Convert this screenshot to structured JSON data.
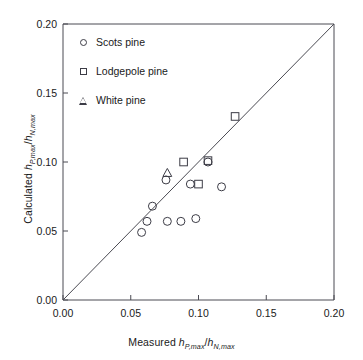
{
  "chart_data": {
    "type": "scatter",
    "title": "",
    "xlabel": "Measured h_{P,max}/h_{N,max}",
    "ylabel": "Calculated h_{P,max}/h_{N,max}",
    "xlim": [
      0.0,
      0.2
    ],
    "ylim": [
      0.0,
      0.2
    ],
    "xticks": [
      "0.00",
      "0.05",
      "0.10",
      "0.15",
      "0.20"
    ],
    "yticks": [
      "0.00",
      "0.05",
      "0.10",
      "0.15",
      "0.20"
    ],
    "xtick_values": [
      0.0,
      0.05,
      0.1,
      0.15,
      0.2
    ],
    "ytick_values": [
      0.0,
      0.05,
      0.1,
      0.15,
      0.2
    ],
    "grid": false,
    "legend_position": "upper-left",
    "reference_line": {
      "type": "identity",
      "from": [
        0.0,
        0.0
      ],
      "to": [
        0.2,
        0.2
      ],
      "label": "1:1 line"
    },
    "series": [
      {
        "name": "Scots pine",
        "marker": "circle",
        "color": "#3c3c46",
        "points": [
          [
            0.058,
            0.049
          ],
          [
            0.062,
            0.057
          ],
          [
            0.066,
            0.068
          ],
          [
            0.076,
            0.087
          ],
          [
            0.077,
            0.057
          ],
          [
            0.087,
            0.057
          ],
          [
            0.098,
            0.059
          ],
          [
            0.094,
            0.084
          ],
          [
            0.107,
            0.1
          ],
          [
            0.117,
            0.082
          ]
        ]
      },
      {
        "name": "Lodgepole pine",
        "marker": "square",
        "color": "#3c3c46",
        "points": [
          [
            0.089,
            0.1
          ],
          [
            0.1,
            0.084
          ],
          [
            0.107,
            0.101
          ],
          [
            0.127,
            0.133
          ]
        ]
      },
      {
        "name": "White pine",
        "marker": "triangle",
        "color": "#3c3c46",
        "points": [
          [
            0.077,
            0.092
          ]
        ]
      }
    ]
  },
  "axis": {
    "x_label_parts": {
      "prefix": "Measured ",
      "h1": "h",
      "sub1": "P,max",
      "slash": "/",
      "h2": "h",
      "sub2": "N,max"
    },
    "y_label_parts": {
      "prefix": "Calculated ",
      "h1": "h",
      "sub1": "P,max",
      "slash": "/",
      "h2": "h",
      "sub2": "N,max"
    }
  },
  "legend": {
    "items": [
      {
        "label": "Scots pine",
        "marker": "circle-marker"
      },
      {
        "label": "Lodgepole pine",
        "marker": "square-marker"
      },
      {
        "label": "White pine",
        "marker": "triangle-marker"
      }
    ]
  },
  "colors": {
    "frame": "#4a4a52",
    "marker": "#3c3c46",
    "text": "#1a1a1a",
    "background": "#ffffff"
  }
}
